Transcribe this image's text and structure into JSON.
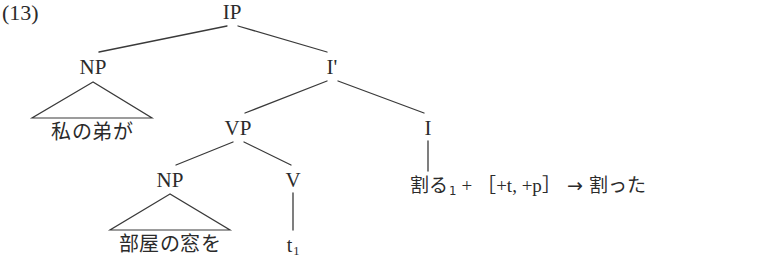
{
  "figure": {
    "example_number": "(13)"
  },
  "tree": {
    "nodes": [
      {
        "id": "ip",
        "label": "IP",
        "x": 232,
        "y": 2
      },
      {
        "id": "np1",
        "label": "NP",
        "x": 93,
        "y": 57
      },
      {
        "id": "ibar",
        "label": "I'",
        "x": 332,
        "y": 57
      },
      {
        "id": "vp",
        "label": "VP",
        "x": 238,
        "y": 118
      },
      {
        "id": "i",
        "label": "I",
        "x": 428,
        "y": 118
      },
      {
        "id": "np2",
        "label": "NP",
        "x": 170,
        "y": 170
      },
      {
        "id": "v",
        "label": "V",
        "x": 293,
        "y": 170
      }
    ],
    "branches": [
      {
        "from": "ip",
        "to": "np1",
        "x1": 227,
        "y1": 26,
        "x2": 99,
        "y2": 52
      },
      {
        "from": "ip",
        "to": "ibar",
        "x1": 238,
        "y1": 26,
        "x2": 327,
        "y2": 52
      },
      {
        "from": "ibar",
        "to": "vp",
        "x1": 327,
        "y1": 81,
        "x2": 245,
        "y2": 113
      },
      {
        "from": "ibar",
        "to": "i",
        "x1": 338,
        "y1": 81,
        "x2": 424,
        "y2": 113
      },
      {
        "from": "vp",
        "to": "np2",
        "x1": 233,
        "y1": 142,
        "x2": 176,
        "y2": 165
      },
      {
        "from": "vp",
        "to": "v",
        "x1": 244,
        "y1": 142,
        "x2": 291,
        "y2": 165
      }
    ],
    "stems": [
      {
        "from": "i",
        "x": 428,
        "y1": 141,
        "y2": 171
      },
      {
        "from": "v",
        "x": 293,
        "y1": 193,
        "y2": 230
      }
    ],
    "triangles": [
      {
        "id": "np1-triangle",
        "apex_x": 93,
        "apex_y": 82,
        "left_x": 32,
        "right_x": 152,
        "base_y": 118
      },
      {
        "id": "np2-triangle",
        "apex_x": 170,
        "apex_y": 194,
        "left_x": 110,
        "right_x": 230,
        "base_y": 230
      }
    ],
    "terminals": [
      {
        "id": "np1-terminal",
        "text": "私の弟が",
        "x": 92,
        "y": 122
      },
      {
        "id": "np2-terminal",
        "text": "部屋の窓を",
        "x": 170,
        "y": 234
      },
      {
        "id": "v-trace",
        "text": "t",
        "subscript": "1",
        "x": 293,
        "y": 235
      }
    ]
  },
  "derivation": {
    "x": 410,
    "y": 176,
    "base_form": "割る",
    "base_index": "1",
    "plus": "+",
    "bracket_open": "［",
    "features": "+t, +p",
    "bracket_close": "］",
    "arrow": "→",
    "result": "割った",
    "full_text": "割る1 + ［+t, +p］ → 割った"
  },
  "style": {
    "line_color": "#3a3a3a",
    "text_color": "#2b2b2b",
    "background": "#ffffff"
  }
}
